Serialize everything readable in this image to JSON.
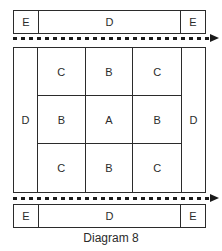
{
  "diagram": {
    "caption": "Diagram 8",
    "colors": {
      "stroke": "#2b2b2b",
      "arrow": "#1a1a1a",
      "background": "#ffffff",
      "text": "#2b2b2b"
    },
    "top_bar": {
      "name": "top-end-bar",
      "left_label": "E",
      "middle_label": "D",
      "right_label": "E"
    },
    "bottom_bar": {
      "name": "bottom-end-bar",
      "left_label": "E",
      "middle_label": "D",
      "right_label": "E"
    },
    "arrows": {
      "top": {
        "style": "dotted",
        "direction": "right"
      },
      "bottom": {
        "style": "dotted",
        "direction": "right"
      }
    },
    "main_block": {
      "left_column_label": "D",
      "right_column_label": "D",
      "matrix": {
        "rows": 3,
        "cols": 3,
        "cells": [
          [
            "C",
            "B",
            "C"
          ],
          [
            "B",
            "A",
            "B"
          ],
          [
            "C",
            "B",
            "C"
          ]
        ]
      }
    }
  }
}
